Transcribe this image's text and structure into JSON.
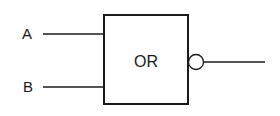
{
  "diagram": {
    "gate": {
      "label": "OR",
      "type": "NOR (OR with inverted output)"
    },
    "inputs": [
      {
        "label": "A"
      },
      {
        "label": "B"
      }
    ],
    "output": {
      "inverted": true
    },
    "colors": {
      "stroke": "#1a1a1a",
      "background": "#ffffff"
    }
  }
}
